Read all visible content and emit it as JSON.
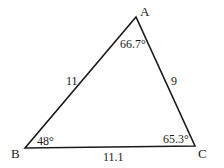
{
  "diagram": {
    "type": "triangle",
    "stroke_color": "#1a1a1a",
    "background": "#ffffff",
    "vertices": [
      {
        "name": "A",
        "x": 136,
        "y": 17,
        "angle": "66.7°"
      },
      {
        "name": "B",
        "x": 25,
        "y": 148,
        "angle": "48°"
      },
      {
        "name": "C",
        "x": 195,
        "y": 146,
        "angle": "65.3°"
      }
    ],
    "sides": [
      {
        "between": "AB",
        "length": "11"
      },
      {
        "between": "AC",
        "length": "9"
      },
      {
        "between": "BC",
        "length": "11.1"
      }
    ]
  }
}
